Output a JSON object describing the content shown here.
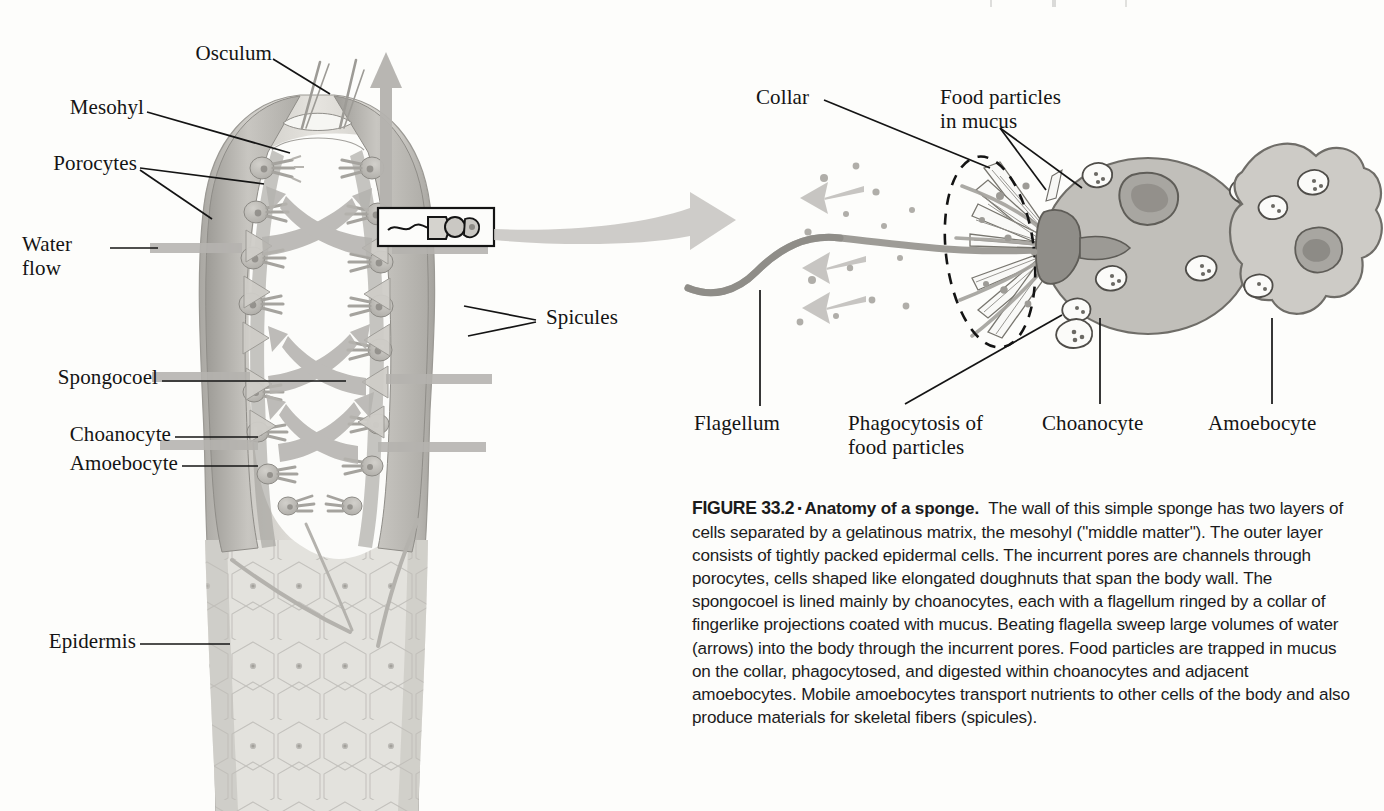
{
  "figure": {
    "id": "FIGURE 33.2",
    "separator": "▪",
    "title": "Anatomy of a sponge.",
    "caption": "The wall of this simple sponge has two layers of cells separated by a gelatinous matrix, the mesohyl (\"middle matter\"). The outer layer consists of tightly packed epidermal cells. The incurrent pores are channels through porocytes, cells shaped like elongated doughnuts that span the body wall. The spongocoel is lined mainly by choanocytes, each with a flagellum ringed by a collar of fingerlike projections coated with mucus. Beating flagella sweep large volumes of water (arrows) into the body through the incurrent pores. Food particles are trapped in mucus on the collar, phagocytosed, and digested within choanocytes and adjacent amoebocytes. Mobile amoebocytes transport nutrients to other cells of the body and also produce materials for skeletal fibers (spicules)."
  },
  "sponge_panel": {
    "labels": {
      "osculum": "Osculum",
      "mesohyl": "Mesohyl",
      "porocytes": "Porocytes",
      "water_flow": "Water\nflow",
      "spicules": "Spicules",
      "spongocoel": "Spongocoel",
      "choanocyte": "Choanocyte",
      "amoebocyte": "Amoebocyte",
      "epidermis": "Epidermis"
    }
  },
  "choanocyte_panel": {
    "labels": {
      "collar": "Collar",
      "food_particles": "Food particles\nin mucus",
      "flagellum": "Flagellum",
      "phagocytosis": "Phagocytosis of\nfood particles",
      "choanocyte": "Choanocyte",
      "amoebocyte": "Amoebocyte"
    }
  },
  "colors": {
    "paper": "#fdfdfb",
    "ink": "#141414",
    "tissue_mid": "#b9b7b2",
    "tissue_dark": "#8e8c87",
    "tissue_light": "#d8d6d1",
    "epidermis": "#dedcd7",
    "arrow_water": "#b3b1ad",
    "cell_body": "#c0beb9"
  }
}
